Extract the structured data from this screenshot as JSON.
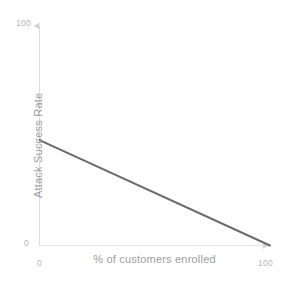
{
  "chart_data": {
    "type": "line",
    "title": "",
    "subtitle": "",
    "xlabel": "% of customers enrolled",
    "ylabel": "Attack Success Rate",
    "xlim": [
      0,
      100
    ],
    "ylim": [
      0,
      100
    ],
    "xticks": [
      "0",
      "100"
    ],
    "yticks": [
      "0",
      "100"
    ],
    "grid": false,
    "legend": null,
    "axis_style": "arrow-tipped",
    "series": [
      {
        "name": "Attack Success Rate",
        "color": "#6b6b6b",
        "x": [
          0,
          100
        ],
        "values": [
          48,
          0
        ]
      }
    ],
    "annotations": []
  },
  "style": {
    "background": "#ffffff",
    "axis_color": "#d9d9d9",
    "axis_arrow_color": "#cfcfcf",
    "tick_label_color": "#b6b6b6",
    "axis_title_color": "#9d9d9d",
    "line_color": "#6b6b6b"
  },
  "labels": {
    "y_tick_top": "100",
    "y_tick_bottom": "0",
    "x_tick_left": "0",
    "x_tick_right": "100",
    "x_axis_title": "% of customers enrolled",
    "y_axis_title": "Attack Success Rate"
  }
}
